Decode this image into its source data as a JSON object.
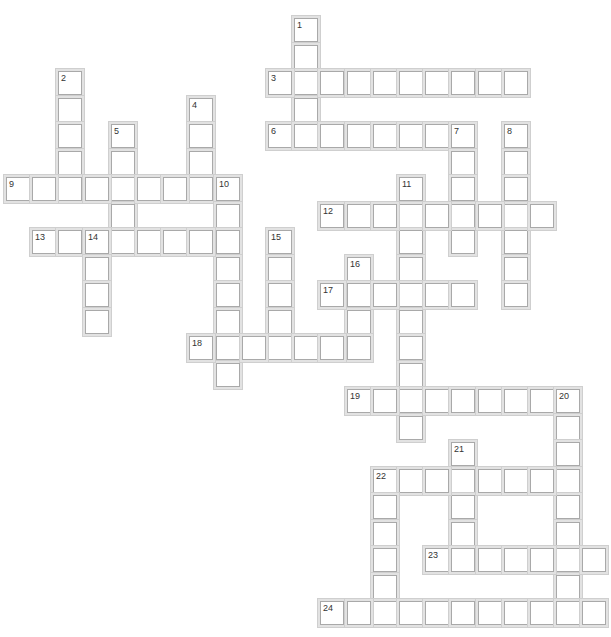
{
  "puzzle": {
    "type": "crossword",
    "grid": {
      "origin_x": 6,
      "origin_y": 18,
      "col_width": 26.2,
      "row_height": 26.5,
      "cell_size": 24
    },
    "words": [
      {
        "number": "1",
        "direction": "down",
        "row": 0,
        "col": 11,
        "length": 4
      },
      {
        "number": "2",
        "direction": "down",
        "row": 2,
        "col": 2,
        "length": 5
      },
      {
        "number": "3",
        "direction": "across",
        "row": 2,
        "col": 10,
        "length": 10
      },
      {
        "number": "4",
        "direction": "down",
        "row": 3,
        "col": 7,
        "length": 4
      },
      {
        "number": "5",
        "direction": "down",
        "row": 4,
        "col": 4,
        "length": 5
      },
      {
        "number": "6",
        "direction": "across",
        "row": 4,
        "col": 10,
        "length": 8
      },
      {
        "number": "7",
        "direction": "down",
        "row": 4,
        "col": 17,
        "length": 5
      },
      {
        "number": "8",
        "direction": "down",
        "row": 4,
        "col": 19,
        "length": 7
      },
      {
        "number": "9",
        "direction": "across",
        "row": 6,
        "col": 0,
        "length": 9
      },
      {
        "number": "10",
        "direction": "down",
        "row": 6,
        "col": 8,
        "length": 8
      },
      {
        "number": "11",
        "direction": "down",
        "row": 6,
        "col": 15,
        "length": 10
      },
      {
        "number": "12",
        "direction": "across",
        "row": 7,
        "col": 12,
        "length": 9
      },
      {
        "number": "13",
        "direction": "across",
        "row": 8,
        "col": 1,
        "length": 8
      },
      {
        "number": "14",
        "direction": "down",
        "row": 8,
        "col": 3,
        "length": 4
      },
      {
        "number": "15",
        "direction": "down",
        "row": 8,
        "col": 10,
        "length": 5
      },
      {
        "number": "16",
        "direction": "down",
        "row": 9,
        "col": 13,
        "length": 4
      },
      {
        "number": "17",
        "direction": "across",
        "row": 10,
        "col": 12,
        "length": 6
      },
      {
        "number": "18",
        "direction": "across",
        "row": 12,
        "col": 7,
        "length": 7
      },
      {
        "number": "19",
        "direction": "across",
        "row": 14,
        "col": 13,
        "length": 9
      },
      {
        "number": "20",
        "direction": "down",
        "row": 14,
        "col": 21,
        "length": 8
      },
      {
        "number": "21",
        "direction": "down",
        "row": 16,
        "col": 17,
        "length": 4
      },
      {
        "number": "22",
        "direction": "across",
        "row": 17,
        "col": 14,
        "length": 8
      },
      {
        "number": "22",
        "direction": "down",
        "row": 17,
        "col": 14,
        "length": 6
      },
      {
        "number": "23",
        "direction": "across",
        "row": 20,
        "col": 16,
        "length": 7
      },
      {
        "number": "24",
        "direction": "across",
        "row": 22,
        "col": 12,
        "length": 11
      }
    ]
  }
}
